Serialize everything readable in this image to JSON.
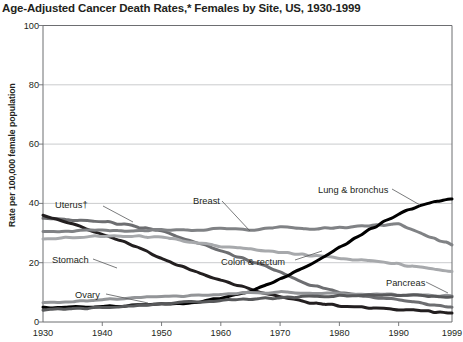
{
  "title": "Age-Adjusted Cancer Death Rates,* Females by Site, US, 1930-1999",
  "axis": {
    "ylabel": "Rate per 100,000 female population",
    "yticks": [
      "0",
      "20",
      "40",
      "60",
      "80",
      "100"
    ],
    "xticks": [
      "1930",
      "1940",
      "1950",
      "1960",
      "1970",
      "1980",
      "1990",
      "1999"
    ]
  },
  "labels": {
    "uterus": "Uterus†",
    "stomach": "Stomach",
    "breast": "Breast",
    "colon_rectum": "Colon & rectum",
    "lung": "Lung & bronchus",
    "ovary": "Ovary",
    "pancreas": "Pancreas"
  },
  "chart_data": {
    "type": "line",
    "title": "Age-Adjusted Cancer Death Rates,* Females by Site, US, 1930-1999",
    "xlabel": "",
    "ylabel": "Rate per 100,000 female population",
    "xlim": [
      1930,
      1999
    ],
    "ylim": [
      0,
      100
    ],
    "grid": "horizontal",
    "legend": "inline-annotations",
    "x": [
      1930,
      1935,
      1940,
      1945,
      1950,
      1955,
      1960,
      1965,
      1970,
      1975,
      1980,
      1985,
      1990,
      1995,
      1999
    ],
    "series": [
      {
        "name": "Uterus†",
        "color": "#6d6e71",
        "values": [
          35.0,
          34.5,
          34.0,
          32.5,
          30.5,
          27.5,
          24.0,
          20.5,
          17.0,
          12.5,
          10.0,
          8.5,
          7.5,
          6.0,
          5.0
        ]
      },
      {
        "name": "Stomach",
        "color": "#231f20",
        "values": [
          36.0,
          33.0,
          29.5,
          26.0,
          21.5,
          17.5,
          14.0,
          11.0,
          8.5,
          6.5,
          5.5,
          4.8,
          4.2,
          3.6,
          3.0
        ]
      },
      {
        "name": "Breast",
        "color": "#808285",
        "values": [
          30.5,
          30.8,
          31.0,
          30.8,
          31.2,
          31.0,
          31.5,
          31.0,
          32.0,
          31.5,
          31.8,
          32.5,
          33.0,
          29.0,
          26.0
        ]
      },
      {
        "name": "Colon & rectum",
        "color": "#a7a9ac",
        "values": [
          28.0,
          28.5,
          29.0,
          29.0,
          28.5,
          27.0,
          25.5,
          24.5,
          23.5,
          22.5,
          21.5,
          20.5,
          19.5,
          18.0,
          17.0
        ]
      },
      {
        "name": "Lung & bronchus",
        "color": "#000000",
        "values": [
          5.0,
          5.0,
          5.2,
          5.5,
          6.0,
          6.5,
          8.0,
          10.5,
          14.5,
          19.5,
          25.0,
          31.0,
          36.5,
          40.0,
          41.5
        ]
      },
      {
        "name": "Ovary",
        "color": "#939598",
        "values": [
          6.5,
          7.0,
          7.5,
          8.0,
          8.5,
          9.0,
          9.5,
          9.8,
          10.0,
          9.8,
          9.5,
          9.3,
          9.2,
          9.0,
          8.8
        ]
      },
      {
        "name": "Pancreas",
        "color": "#58595b",
        "values": [
          4.0,
          4.5,
          5.0,
          5.5,
          6.2,
          6.8,
          7.3,
          7.8,
          8.2,
          8.5,
          8.8,
          9.0,
          9.0,
          8.8,
          8.5
        ]
      }
    ]
  }
}
